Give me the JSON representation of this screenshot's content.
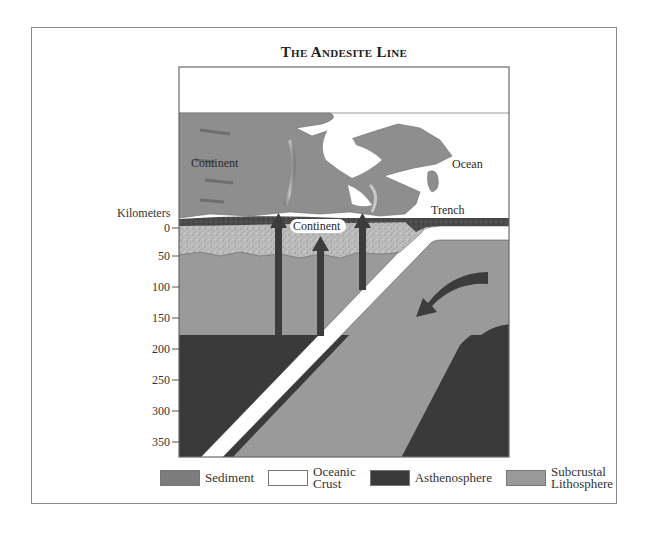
{
  "title": "The Andesite Line",
  "axis": {
    "label": "Kilometers",
    "ticks": [
      "0",
      "50",
      "100",
      "150",
      "200",
      "250",
      "300",
      "350"
    ]
  },
  "labels": {
    "continent_surface": "Continent",
    "continent_crust": "Continent",
    "ocean": "Ocean",
    "trench": "Trench"
  },
  "legend": [
    {
      "key": "sediment",
      "label": "Sediment",
      "color": "#8c8c8c"
    },
    {
      "key": "oceanic-crust",
      "label_line1": "Oceanic",
      "label_line2": "Crust",
      "color": "#ffffff"
    },
    {
      "key": "asthenosphere",
      "label": "Asthenosphere",
      "color": "#3a3a3a"
    },
    {
      "key": "subcrustal-lithosphere",
      "label_line1": "Subcrustal",
      "label_line2": "Lithosphere",
      "color": "#9a9a9a"
    }
  ],
  "colors": {
    "asthenosphere": "#3a3a3a",
    "lithosphere": "#9a9a9a",
    "sediment": "#b8b8b8",
    "continent_surface": "#8e8e8e",
    "arrow": "#3c3c3c"
  }
}
